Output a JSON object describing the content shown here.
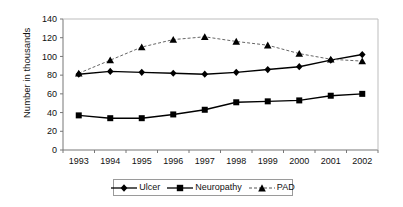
{
  "chart_data": {
    "type": "line",
    "title": "",
    "xlabel": "",
    "ylabel": "Number in thousands",
    "categories": [
      "1993",
      "1994",
      "1995",
      "1996",
      "1997",
      "1998",
      "1999",
      "2000",
      "2001",
      "2002"
    ],
    "x": [
      1993,
      1994,
      1995,
      1996,
      1997,
      1998,
      1999,
      2000,
      2001,
      2002
    ],
    "ylim": [
      0,
      140
    ],
    "yticks": [
      0,
      20,
      40,
      60,
      80,
      100,
      120,
      140
    ],
    "ytick_labels": [
      "0",
      "20",
      "40",
      "60",
      "80",
      "100",
      "120",
      "140"
    ],
    "grid": false,
    "legend_position": "bottom",
    "series": [
      {
        "name": "Ulcer",
        "marker": "diamond",
        "line_style": "solid",
        "color": "#000000",
        "values": [
          81,
          84,
          83,
          82,
          81,
          83,
          86,
          89,
          96,
          102
        ]
      },
      {
        "name": "Neuropathy",
        "marker": "square",
        "line_style": "solid",
        "color": "#000000",
        "values": [
          37,
          34,
          34,
          38,
          43,
          51,
          52,
          53,
          58,
          60
        ]
      },
      {
        "name": "PAD",
        "marker": "triangle",
        "line_style": "dashed",
        "color": "#000000",
        "values": [
          82,
          96,
          110,
          118,
          121,
          116,
          112,
          103,
          97,
          95
        ]
      }
    ]
  },
  "axes": {
    "y_title": "Number in thousands"
  },
  "legend": {
    "items": [
      {
        "label": "Ulcer",
        "marker": "diamond",
        "dashed": false
      },
      {
        "label": "Neuropathy",
        "marker": "square",
        "dashed": false
      },
      {
        "label": "PAD",
        "marker": "triangle",
        "dashed": true
      }
    ]
  },
  "colors": {
    "series": "#000000",
    "axis": "#777777",
    "legend_border": "#9a9a9a",
    "background": "#ffffff"
  }
}
